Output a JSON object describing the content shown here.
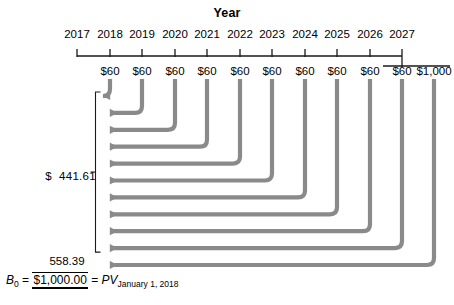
{
  "diagram": {
    "title": "Year",
    "type": "cash-flow-timeline",
    "axis": {
      "tick_labels": [
        "2017",
        "2018",
        "2019",
        "2020",
        "2021",
        "2022",
        "2023",
        "2024",
        "2025",
        "2026",
        "2027"
      ],
      "tick_x": [
        77,
        110,
        142,
        175,
        207,
        240,
        272,
        305,
        337,
        370,
        402
      ],
      "axis_y": 56,
      "axis_x_start": 77,
      "axis_x_end": 402,
      "tail_y": 66,
      "tail_x_start": 383,
      "tail_x_end": 450
    },
    "cash_flows": [
      {
        "year": "2018",
        "amount": "$60",
        "x": 110
      },
      {
        "year": "2019",
        "amount": "$60",
        "x": 142
      },
      {
        "year": "2020",
        "amount": "$60",
        "x": 175
      },
      {
        "year": "2021",
        "amount": "$60",
        "x": 207
      },
      {
        "year": "2022",
        "amount": "$60",
        "x": 240
      },
      {
        "year": "2023",
        "amount": "$60",
        "x": 272
      },
      {
        "year": "2024",
        "amount": "$60",
        "x": 305
      },
      {
        "year": "2025",
        "amount": "$60",
        "x": 337
      },
      {
        "year": "2026",
        "amount": "$60",
        "x": 370
      },
      {
        "year": "2027",
        "amount": "$60",
        "x": 402
      },
      {
        "year": "2027",
        "amount": "$1,000",
        "x": 434
      }
    ],
    "present_value_annuity": {
      "currency": "$",
      "value": "441.61"
    },
    "sum": {
      "top_value": "558.39",
      "bottom_value": "$1,000.00"
    },
    "formula": {
      "lhs_symbol": "B",
      "lhs_subscript": "0",
      "equals_1": "=",
      "equals_2": "=",
      "pv_symbol": "PV",
      "pv_subscript": "January 1, 2018"
    },
    "colors": {
      "arrow": "#8a8a8a",
      "axis": "#1a1a1a",
      "text": "#000000",
      "background": "#ffffff"
    }
  }
}
